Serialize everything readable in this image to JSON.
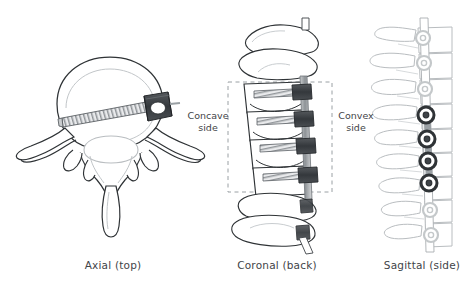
{
  "figure": {
    "background": "#ffffff",
    "ink_dark": "#2f3336",
    "ink_light": "#b9bdc0",
    "hardware_dark": "#3a3f43",
    "hardware_mid": "#8d9296",
    "hardware_light": "#d8dadc",
    "dashed_color": "#9aa0a4",
    "text_color": "#3f4448"
  },
  "panels": [
    {
      "id": "axial",
      "caption": "Axial (top)",
      "description": "Top-down cross-section of a single vertebra with one transverse screw and tulip head on the right",
      "screw_count": 1,
      "screw_head_count": 1
    },
    {
      "id": "coronal",
      "caption": "Coronal (back)",
      "description": "Front-back view of a spine segment with four screws and a vertical tether rod on the convex side",
      "screw_count": 4,
      "screw_head_count": 4,
      "instrumented_levels": 4,
      "extra_screws_below": 2
    },
    {
      "id": "sagittal",
      "caption": "Sagittal (side)",
      "description": "Side view of the spine showing the tether line with nine screw head markers, four of them instrumented",
      "marker_count": 9,
      "instrumented_markers": 4
    }
  ],
  "annotations": {
    "concave": {
      "line1": "Concave",
      "line2": "side"
    },
    "convex": {
      "line1": "Convex",
      "line2": "side"
    }
  },
  "sagittal_markers": [
    {
      "index": 1,
      "y": 38,
      "state": "light"
    },
    {
      "index": 2,
      "y": 63,
      "state": "light"
    },
    {
      "index": 3,
      "y": 89,
      "state": "light"
    },
    {
      "index": 4,
      "y": 115,
      "state": "dark"
    },
    {
      "index": 5,
      "y": 139,
      "state": "dark"
    },
    {
      "index": 6,
      "y": 160,
      "state": "dark"
    },
    {
      "index": 7,
      "y": 183,
      "state": "dark"
    },
    {
      "index": 8,
      "y": 210,
      "state": "light"
    },
    {
      "index": 9,
      "y": 235,
      "state": "light"
    }
  ],
  "coronal_screws": [
    {
      "index": 1,
      "y": 92
    },
    {
      "index": 2,
      "y": 119
    },
    {
      "index": 3,
      "y": 146
    },
    {
      "index": 4,
      "y": 175
    }
  ]
}
